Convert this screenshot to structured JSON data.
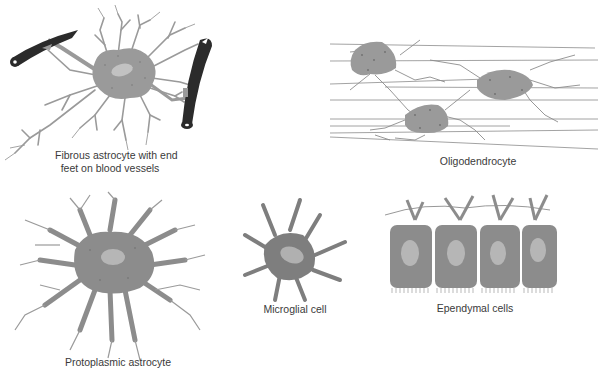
{
  "figure": {
    "colors": {
      "cytoplasm": "#9a9a9a",
      "cytoplasm_dark": "#7e7e7e",
      "nucleus": "#c2c2c2",
      "vessel": "#2b2b2b",
      "fiber": "#8c8c8c",
      "text": "#3a3a3a"
    },
    "panels": [
      {
        "id": "fibrous-astrocyte",
        "caption_line1": "Fibrous astrocyte with end",
        "caption_line2": "feet on blood vessels"
      },
      {
        "id": "oligodendrocyte",
        "caption": "Oligodendrocyte"
      },
      {
        "id": "protoplasmic-astrocyte",
        "caption": "Protoplasmic astrocyte"
      },
      {
        "id": "microglial-cell",
        "caption": "Microglial cell"
      },
      {
        "id": "ependymal-cells",
        "caption": "Ependymal cells"
      }
    ]
  }
}
